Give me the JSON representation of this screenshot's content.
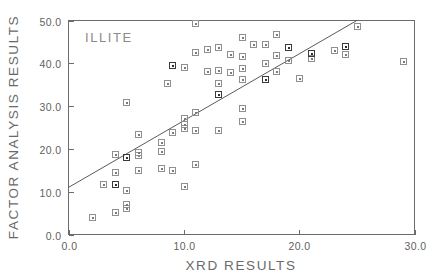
{
  "chart_data": {
    "type": "scatter",
    "title": "",
    "annotation": "ILLITE",
    "xlabel": "XRD  RESULTS",
    "ylabel": "FACTOR  ANALYSIS  RESULTS",
    "xlim": [
      0.0,
      30.0
    ],
    "ylim": [
      0.0,
      50.0
    ],
    "xticks": [
      0.0,
      10.0,
      20.0,
      30.0
    ],
    "yticks": [
      0.0,
      10.0,
      20.0,
      30.0,
      40.0,
      50.0
    ],
    "xticklabels": [
      "0.0",
      "10.0",
      "20.0",
      "30.0"
    ],
    "yticklabels": [
      "0.0",
      "10.0",
      "20.0",
      "30.0",
      "40.0",
      "50.0"
    ],
    "grid": false,
    "legend": false,
    "marker": "square-with-center-dot",
    "trendline": {
      "label": "regression-line",
      "x": [
        0.0,
        25.0
      ],
      "y": [
        11.0,
        50.0
      ]
    },
    "points": [
      {
        "x": 2.0,
        "y": 4.2
      },
      {
        "x": 3.0,
        "y": 11.8
      },
      {
        "x": 4.0,
        "y": 5.2
      },
      {
        "x": 4.0,
        "y": 11.7,
        "weight": "dark"
      },
      {
        "x": 4.0,
        "y": 14.5
      },
      {
        "x": 4.0,
        "y": 18.8
      },
      {
        "x": 5.0,
        "y": 6.2
      },
      {
        "x": 5.0,
        "y": 7.2
      },
      {
        "x": 5.0,
        "y": 10.4
      },
      {
        "x": 5.0,
        "y": 18.0,
        "weight": "dark"
      },
      {
        "x": 5.0,
        "y": 31.0
      },
      {
        "x": 6.0,
        "y": 15.0
      },
      {
        "x": 6.0,
        "y": 18.5
      },
      {
        "x": 6.0,
        "y": 19.2
      },
      {
        "x": 6.0,
        "y": 23.4
      },
      {
        "x": 8.0,
        "y": 15.5
      },
      {
        "x": 8.0,
        "y": 19.6
      },
      {
        "x": 8.0,
        "y": 21.5
      },
      {
        "x": 8.5,
        "y": 35.3
      },
      {
        "x": 9.0,
        "y": 15.0
      },
      {
        "x": 9.0,
        "y": 23.9
      },
      {
        "x": 9.0,
        "y": 39.6,
        "weight": "dark"
      },
      {
        "x": 10.0,
        "y": 11.3
      },
      {
        "x": 10.0,
        "y": 24.8
      },
      {
        "x": 10.0,
        "y": 25.8
      },
      {
        "x": 10.0,
        "y": 27.2
      },
      {
        "x": 10.0,
        "y": 39.2
      },
      {
        "x": 11.0,
        "y": 16.4
      },
      {
        "x": 11.0,
        "y": 24.5
      },
      {
        "x": 11.0,
        "y": 28.7
      },
      {
        "x": 11.0,
        "y": 42.7
      },
      {
        "x": 11.0,
        "y": 49.5
      },
      {
        "x": 12.0,
        "y": 38.3
      },
      {
        "x": 12.0,
        "y": 43.4
      },
      {
        "x": 13.0,
        "y": 24.4
      },
      {
        "x": 13.0,
        "y": 32.8,
        "weight": "dark"
      },
      {
        "x": 13.0,
        "y": 35.4
      },
      {
        "x": 13.0,
        "y": 38.4
      },
      {
        "x": 13.0,
        "y": 43.8
      },
      {
        "x": 14.0,
        "y": 37.9
      },
      {
        "x": 14.0,
        "y": 42.2
      },
      {
        "x": 15.0,
        "y": 26.6
      },
      {
        "x": 15.0,
        "y": 29.6
      },
      {
        "x": 15.0,
        "y": 36.4
      },
      {
        "x": 15.0,
        "y": 38.9
      },
      {
        "x": 15.0,
        "y": 41.6
      },
      {
        "x": 15.0,
        "y": 46.2
      },
      {
        "x": 16.0,
        "y": 44.5
      },
      {
        "x": 17.0,
        "y": 36.4,
        "weight": "dark"
      },
      {
        "x": 17.0,
        "y": 40.0
      },
      {
        "x": 17.0,
        "y": 44.4
      },
      {
        "x": 18.0,
        "y": 38.2
      },
      {
        "x": 18.0,
        "y": 41.9
      },
      {
        "x": 18.0,
        "y": 46.8
      },
      {
        "x": 19.0,
        "y": 40.8
      },
      {
        "x": 19.0,
        "y": 43.8,
        "weight": "dark"
      },
      {
        "x": 20.0,
        "y": 36.6
      },
      {
        "x": 21.0,
        "y": 41.3
      },
      {
        "x": 21.0,
        "y": 42.3,
        "weight": "dark"
      },
      {
        "x": 23.0,
        "y": 43.0
      },
      {
        "x": 24.0,
        "y": 42.2
      },
      {
        "x": 24.0,
        "y": 44.0,
        "weight": "dark"
      },
      {
        "x": 25.0,
        "y": 48.8
      },
      {
        "x": 29.0,
        "y": 40.5
      }
    ]
  }
}
